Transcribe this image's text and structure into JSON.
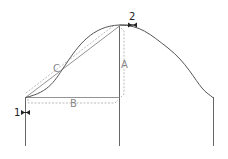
{
  "diagram": {
    "labels": {
      "a": "A",
      "b": "B",
      "c": "C",
      "point1": "1",
      "point2": "2"
    },
    "colors": {
      "line": "#555555",
      "dashed": "#aaaaaa",
      "label": "#777777",
      "marker": "#222222"
    }
  }
}
